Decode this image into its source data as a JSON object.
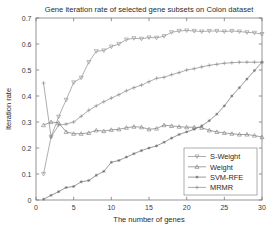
{
  "chart_data": {
    "type": "line",
    "title": "Gene iteration rate of selected gene subsets on Colon dataset",
    "xlabel": "The number of genes",
    "ylabel": "Iteration rate",
    "xlim": [
      0,
      30
    ],
    "ylim": [
      0,
      0.7
    ],
    "xticks": [
      0,
      5,
      10,
      15,
      20,
      25,
      30
    ],
    "xtick_labels": [
      "0",
      "5",
      "10",
      "15",
      "20",
      "25",
      "30"
    ],
    "yticks": [
      0,
      0.1,
      0.2,
      0.3,
      0.4,
      0.5,
      0.6,
      0.7
    ],
    "ytick_labels": [
      "0",
      "0.1",
      "0.2",
      "0.3",
      "0.4",
      "0.5",
      "0.6",
      "0.7"
    ],
    "grid": false,
    "legend_position": "lower right",
    "x": [
      1,
      2,
      3,
      4,
      5,
      6,
      7,
      8,
      9,
      10,
      11,
      12,
      13,
      14,
      15,
      16,
      17,
      18,
      19,
      20,
      21,
      22,
      23,
      24,
      25,
      26,
      27,
      28,
      29,
      30
    ],
    "series": [
      {
        "name": "S-Weight",
        "marker": "down-triangle",
        "color": "#8c8c8c",
        "values": [
          0.1,
          0.243,
          0.32,
          0.385,
          0.452,
          0.47,
          0.53,
          0.572,
          0.575,
          0.59,
          0.6,
          0.617,
          0.622,
          0.62,
          0.625,
          0.624,
          0.63,
          0.645,
          0.65,
          0.652,
          0.65,
          0.648,
          0.65,
          0.65,
          0.648,
          0.65,
          0.648,
          0.645,
          0.643,
          0.638
        ]
      },
      {
        "name": "Weight",
        "marker": "up-triangle",
        "color": "#7a7a7a",
        "values": [
          0.288,
          0.3,
          0.297,
          0.262,
          0.255,
          0.255,
          0.258,
          0.268,
          0.265,
          0.27,
          0.272,
          0.278,
          0.282,
          0.28,
          0.272,
          0.275,
          0.288,
          0.285,
          0.282,
          0.28,
          0.28,
          0.278,
          0.268,
          0.262,
          0.258,
          0.255,
          0.252,
          0.252,
          0.248,
          0.242
        ]
      },
      {
        "name": "SVM-RFE",
        "marker": "star",
        "color": "#6e6e6e",
        "values": [
          0.003,
          0.018,
          0.032,
          0.048,
          0.052,
          0.07,
          0.075,
          0.095,
          0.11,
          0.145,
          0.152,
          0.165,
          0.178,
          0.19,
          0.2,
          0.208,
          0.222,
          0.238,
          0.252,
          0.262,
          0.272,
          0.285,
          0.305,
          0.33,
          0.362,
          0.4,
          0.432,
          0.465,
          0.498,
          0.53
        ]
      },
      {
        "name": "MRMR",
        "marker": "plus",
        "color": "#8a8a8a",
        "values": [
          0.45,
          0.242,
          0.288,
          0.292,
          0.3,
          0.322,
          0.345,
          0.362,
          0.378,
          0.392,
          0.405,
          0.42,
          0.432,
          0.442,
          0.455,
          0.468,
          0.472,
          0.482,
          0.49,
          0.5,
          0.505,
          0.512,
          0.518,
          0.522,
          0.526,
          0.528,
          0.53,
          0.53,
          0.53,
          0.53
        ]
      }
    ]
  }
}
